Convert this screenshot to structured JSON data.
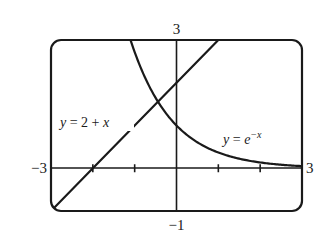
{
  "chart_data": {
    "type": "line",
    "title": "",
    "xlabel": "",
    "ylabel": "",
    "xlim": [
      -3,
      3
    ],
    "ylim": [
      -1,
      3
    ],
    "grid": false,
    "legend": "none",
    "x_ticks": [
      -2,
      -1,
      0,
      1,
      2
    ],
    "y_ticks": [],
    "window_labels": {
      "xmin": "−3",
      "xmax": "3",
      "ymin": "−1",
      "ymax": "3"
    },
    "series": [
      {
        "name": "y = 2 + x",
        "expression": "2 + x",
        "x": [
          -3,
          -2,
          -1,
          0,
          1
        ],
        "values": [
          -1,
          0,
          1,
          2,
          3
        ]
      },
      {
        "name": "y = e^-x",
        "expression": "e^(-x)",
        "x": [
          -1.1,
          -1,
          -0.5,
          0,
          0.5,
          1,
          1.5,
          2,
          2.5,
          3
        ],
        "values": [
          3.0,
          2.72,
          1.65,
          1.0,
          0.61,
          0.37,
          0.22,
          0.14,
          0.08,
          0.05
        ]
      }
    ],
    "annotations": [
      {
        "text": "y = 2 + x",
        "near_series": 0
      },
      {
        "text": "y = e^−x",
        "near_series": 1
      }
    ],
    "colors": {
      "stroke": "#1a1a1a",
      "background": "#ffffff"
    }
  },
  "labels": {
    "xmin": "−3",
    "xmax": "3",
    "ymin": "−1",
    "ymax": "3",
    "line_eq_lhs": "y",
    "line_eq_rhs": " = 2 + ",
    "line_eq_var": "x",
    "exp_eq_lhs": "y",
    "exp_eq_eq": " = ",
    "exp_eq_base": "e",
    "exp_eq_exp": "−x"
  }
}
